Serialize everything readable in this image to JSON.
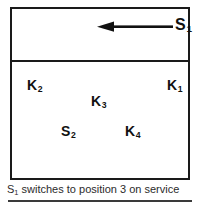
{
  "diagram": {
    "upper_compartment": {
      "arrow": {
        "icon": "arrow-left-icon",
        "direction": "left",
        "label_base": "S",
        "label_sub": "1",
        "label_full": "S1"
      }
    },
    "lower_compartment": {
      "nodes": [
        {
          "id": "k2",
          "base": "K",
          "sub": "2"
        },
        {
          "id": "k1",
          "base": "K",
          "sub": "1"
        },
        {
          "id": "k3",
          "base": "K",
          "sub": "3"
        },
        {
          "id": "s2",
          "base": "S",
          "sub": "2"
        },
        {
          "id": "k4",
          "base": "K",
          "sub": "4"
        }
      ]
    }
  },
  "caption": {
    "prefix": "S",
    "sub": "1",
    "text": " switches to position 3 on service",
    "full": "S1 switches to position 3 on service"
  },
  "colors": {
    "frame": "#1a1a1a",
    "arrow": "#111111",
    "caption_text": "#2b2b2b",
    "rule": "#3a3a3a",
    "background": "#ffffff"
  }
}
